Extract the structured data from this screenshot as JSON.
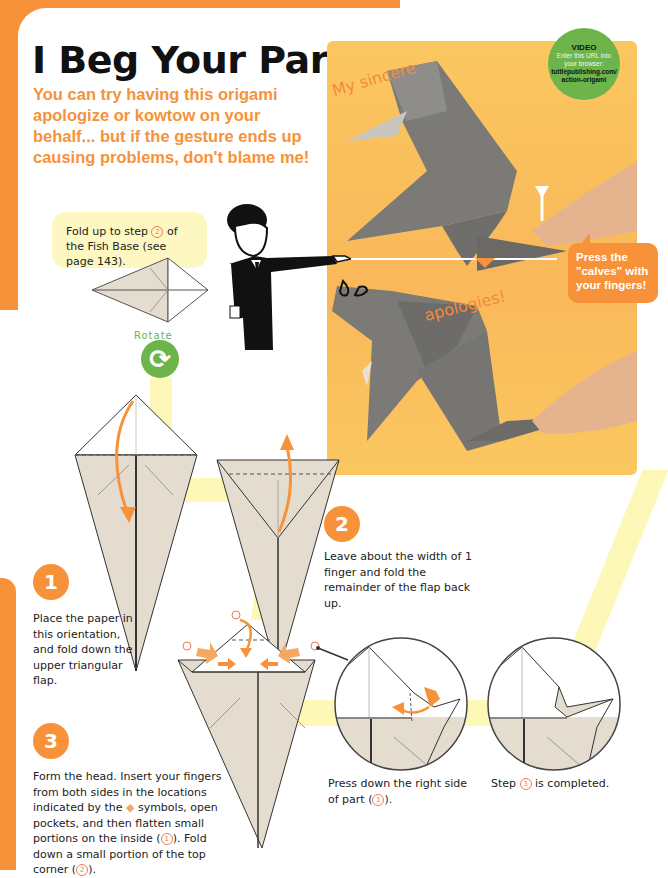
{
  "page": {
    "title": "I Beg Your Pardon!",
    "subtitle": "You can try having this origami apologize or kowtow on your behalf... but if the gesture ends up causing problems, don't blame me!",
    "accent_color": "#f7923a",
    "highlight_color": "#fdf7b8",
    "green_color": "#6db44b"
  },
  "video_badge": {
    "title": "VIDEO",
    "line1": "Enter this URL into",
    "line2": "your browser:",
    "url1": "tuttlepublishing.com/",
    "url2": "action-origami"
  },
  "photo": {
    "caption_top": "My sincere",
    "caption_bottom": "apologies!",
    "callout": "Press the \"calves\" with your fingers!"
  },
  "intro": {
    "bubble_before": "Fold up to step ",
    "bubble_ref": "2",
    "bubble_after": " of the Fish Base (see page 143).",
    "rotate_label": "Rotate"
  },
  "steps": [
    {
      "number": "1",
      "text": "Place the paper in this orientation, and fold down the upper triangular flap."
    },
    {
      "number": "2",
      "text": "Leave about the width of 1 finger and fold the remainder of the flap back up."
    },
    {
      "number": "3",
      "text_parts": [
        "Form the head. Insert your fingers from both sides in the locations indicated by the ",
        " symbols, open pockets, and then flatten small portions on the inside (",
        "1",
        "). Fold down a small portion of the top corner (",
        "2",
        ")."
      ]
    }
  ],
  "detail_a": {
    "text_before": "Press down the right side of part (",
    "ref": "1",
    "text_after": ")."
  },
  "detail_b": {
    "text_before": "Step ",
    "ref": "3",
    "text_after": " is completed."
  },
  "markers": {
    "one": "1",
    "two": "2"
  }
}
